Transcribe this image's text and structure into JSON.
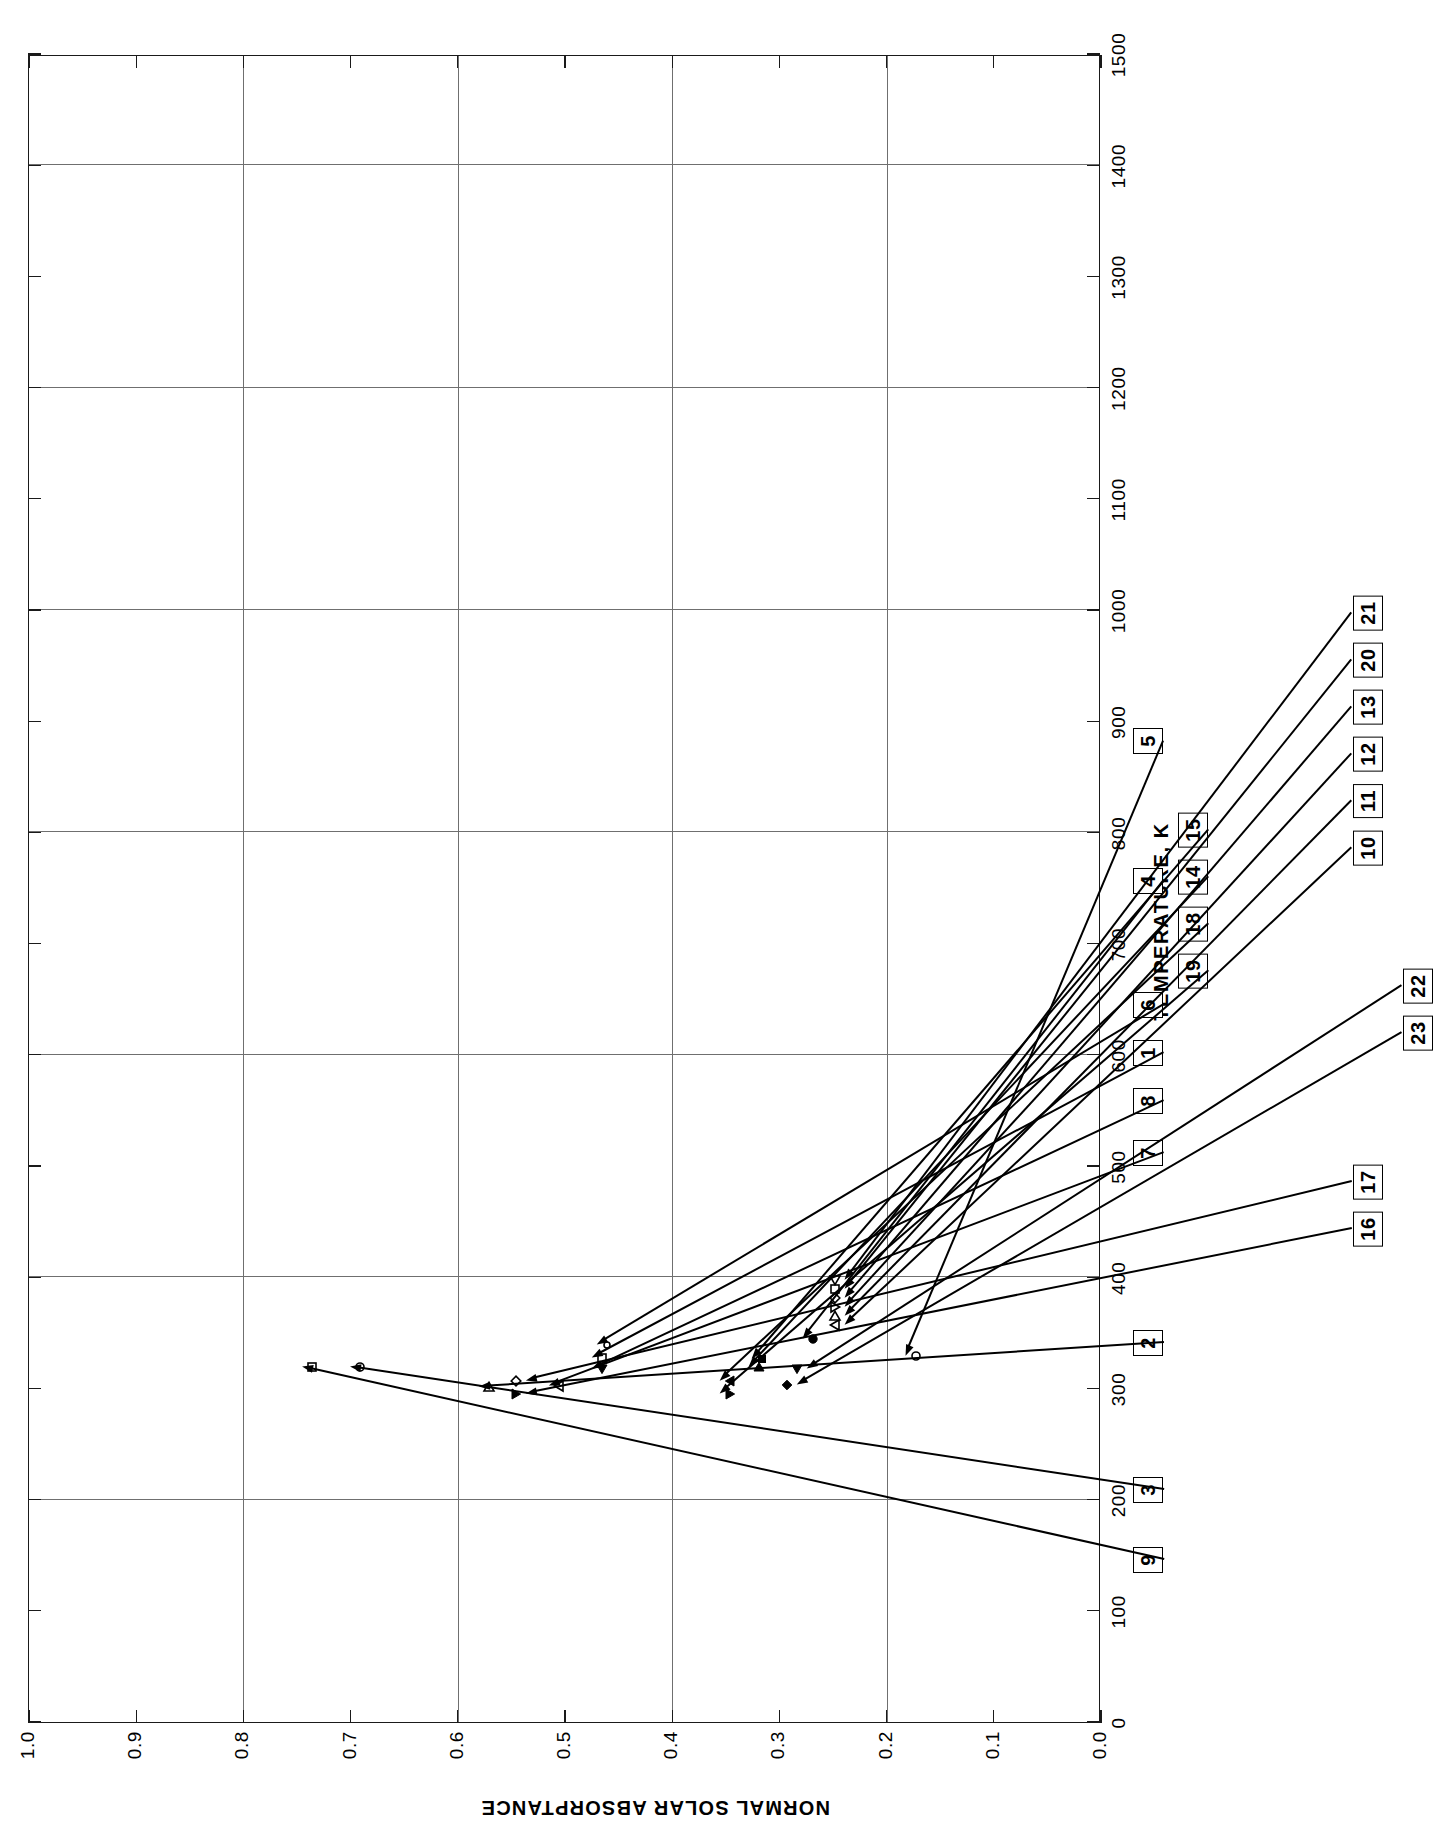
{
  "figure": {
    "number_label": "FIGURE 327",
    "title_lines": [
      "NORMAL",
      "SOLAR",
      "ABSORPTANCE OF",
      "ALUMINUM + COPPER + ΣX"
    ],
    "title_subscript": "i",
    "title_tail": " ALLOYS"
  },
  "chart_data": {
    "type": "scatter",
    "title": "NORMAL SOLAR ABSORPTANCE OF ALUMINUM + COPPER + ΣXi ALLOYS",
    "xlabel": "TEMPERATURE, K",
    "ylabel": "NORMAL SOLAR ABSORPTANCE",
    "xlim": [
      0,
      1500
    ],
    "ylim": [
      0.0,
      1.0
    ],
    "grid": true,
    "legend": "none",
    "x_ticks": [
      0,
      100,
      200,
      300,
      400,
      500,
      600,
      700,
      800,
      900,
      1000,
      1100,
      1200,
      1300,
      1400,
      1500
    ],
    "x_tick_labels": [
      "0",
      "100",
      "200",
      "300",
      "400",
      "500",
      "600",
      "700",
      "800",
      "900",
      "1000",
      "1100",
      "1200",
      "1300",
      "1400",
      "1500"
    ],
    "x_major_gridlines": [
      200,
      400,
      600,
      800,
      1000,
      1200,
      1400
    ],
    "y_ticks": [
      0.0,
      0.1,
      0.2,
      0.3,
      0.4,
      0.5,
      0.6,
      0.7,
      0.8,
      0.9,
      1.0
    ],
    "y_tick_labels": [
      "0.0",
      "0.1",
      "0.2",
      "0.3",
      "0.4",
      "0.5",
      "0.6",
      "0.7",
      "0.8",
      "0.9",
      "1.0"
    ],
    "y_major_gridlines": [
      0.2,
      0.4,
      0.6,
      0.8
    ],
    "points": [
      {
        "curve": "9",
        "x": 320,
        "y": 0.735,
        "marker": "square-open"
      },
      {
        "curve": "3",
        "x": 320,
        "y": 0.69,
        "marker": "circle-open"
      },
      {
        "curve": "2",
        "x": 302,
        "y": 0.57,
        "marker": "triangle-right-open"
      },
      {
        "curve": "16",
        "x": 296,
        "y": 0.545,
        "marker": "triangle-down-filled"
      },
      {
        "curve": "17",
        "x": 308,
        "y": 0.545,
        "marker": "diamond-open"
      },
      {
        "curve": "7",
        "x": 303,
        "y": 0.505,
        "marker": "triangle-up-open"
      },
      {
        "curve": "8",
        "x": 318,
        "y": 0.465,
        "marker": "triangle-left-filled"
      },
      {
        "curve": "1",
        "x": 328,
        "y": 0.465,
        "marker": "square-open"
      },
      {
        "curve": "6",
        "x": 340,
        "y": 0.46,
        "marker": "circle-open-small"
      },
      {
        "curve": "19",
        "x": 296,
        "y": 0.345,
        "marker": "triangle-down-filled"
      },
      {
        "curve": "18",
        "x": 308,
        "y": 0.345,
        "marker": "triangle-up-filled"
      },
      {
        "curve": "14",
        "x": 320,
        "y": 0.318,
        "marker": "triangle-right-filled"
      },
      {
        "curve": "15",
        "x": 327,
        "y": 0.315,
        "marker": "square-filled"
      },
      {
        "curve": "4",
        "x": 345,
        "y": 0.268,
        "marker": "circle-filled"
      },
      {
        "curve": "23",
        "x": 304,
        "y": 0.292,
        "marker": "diamond-filled"
      },
      {
        "curve": "22",
        "x": 318,
        "y": 0.283,
        "marker": "triangle-left-filled"
      },
      {
        "curve": "10",
        "x": 358,
        "y": 0.247,
        "marker": "triangle-up-open"
      },
      {
        "curve": "11",
        "x": 366,
        "y": 0.247,
        "marker": "triangle-right-open"
      },
      {
        "curve": "12",
        "x": 374,
        "y": 0.247,
        "marker": "triangle-down-open"
      },
      {
        "curve": "13",
        "x": 382,
        "y": 0.247,
        "marker": "diamond-open"
      },
      {
        "curve": "20",
        "x": 390,
        "y": 0.247,
        "marker": "square-open"
      },
      {
        "curve": "21",
        "x": 398,
        "y": 0.247,
        "marker": "triangle-left-open"
      },
      {
        "curve": "5",
        "x": 330,
        "y": 0.172,
        "marker": "circle-open"
      }
    ],
    "callouts": [
      "9",
      "3",
      "2",
      "7",
      "8",
      "1",
      "6",
      "4",
      "19",
      "18",
      "14",
      "15",
      "5",
      "16",
      "17",
      "23",
      "22",
      "10",
      "11",
      "12",
      "13",
      "20",
      "21"
    ]
  }
}
